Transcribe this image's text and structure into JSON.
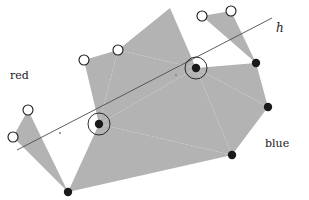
{
  "figure": {
    "type": "geometric-diagram",
    "width": 309,
    "height": 200,
    "background_color": "#ffffff"
  },
  "labels": {
    "red": "red",
    "blue": "blue",
    "line": "h"
  },
  "label_positions": {
    "red": {
      "x": 10,
      "y": 79
    },
    "blue": {
      "x": 265,
      "y": 147
    },
    "line": {
      "x": 276,
      "y": 32
    }
  },
  "colors": {
    "triangle_fill": "#b3b3b3",
    "stroke": "#1a1a1a",
    "red_point_fill": "#ffffff",
    "blue_point_fill": "#1a1a1a",
    "line_color": "#4d4d4d",
    "highlight_ring": "#1a1a1a"
  },
  "line_h": {
    "name": "h",
    "x1": 17,
    "y1": 150,
    "x2": 272,
    "y2": 18,
    "stroke_width": 0.9
  },
  "red_points": [
    {
      "id": "r1",
      "x": 84,
      "y": 60,
      "r": 5
    },
    {
      "id": "r2",
      "x": 118,
      "y": 50,
      "r": 5
    },
    {
      "id": "r3",
      "x": 202,
      "y": 16,
      "r": 5
    },
    {
      "id": "r4",
      "x": 231,
      "y": 11,
      "r": 5
    },
    {
      "id": "r5",
      "x": 28,
      "y": 110,
      "r": 5
    },
    {
      "id": "r6",
      "x": 13,
      "y": 137,
      "r": 5
    }
  ],
  "blue_points": [
    {
      "id": "b1",
      "x": 99,
      "y": 124,
      "r": 4.2,
      "circled": true
    },
    {
      "id": "b2",
      "x": 196,
      "y": 68,
      "r": 4.2,
      "circled": true
    },
    {
      "id": "b3",
      "x": 256,
      "y": 63,
      "r": 4.2,
      "circled": false
    },
    {
      "id": "b4",
      "x": 268,
      "y": 107,
      "r": 4.2,
      "circled": false
    },
    {
      "id": "b5",
      "x": 232,
      "y": 155,
      "r": 4.2,
      "circled": false
    },
    {
      "id": "b6",
      "x": 68,
      "y": 192,
      "r": 4.2,
      "circled": false
    }
  ],
  "highlight_rings": [
    {
      "x": 99,
      "y": 124,
      "r": 11
    },
    {
      "x": 196,
      "y": 68,
      "r": 11
    }
  ],
  "triangles": [
    {
      "id": "t1",
      "points": "84,60 118,50 99,124"
    },
    {
      "id": "t2",
      "points": "118,50 196,68 99,124"
    },
    {
      "id": "t3",
      "points": "28,110 13,137 68,192"
    },
    {
      "id": "t4",
      "points": "99,124 68,192 232,155"
    },
    {
      "id": "t5",
      "points": "99,124 232,155 196,68"
    },
    {
      "id": "t6",
      "points": "196,68 256,63 268,107"
    },
    {
      "id": "t7",
      "points": "196,68 268,107 232,155"
    },
    {
      "id": "t8",
      "points": "202,16 231,11 256,63"
    },
    {
      "id": "t9",
      "points": "118,50 196,68 170,8"
    }
  ],
  "center_marks": [
    {
      "x": 176,
      "y": 75
    },
    {
      "x": 60,
      "y": 133
    }
  ]
}
